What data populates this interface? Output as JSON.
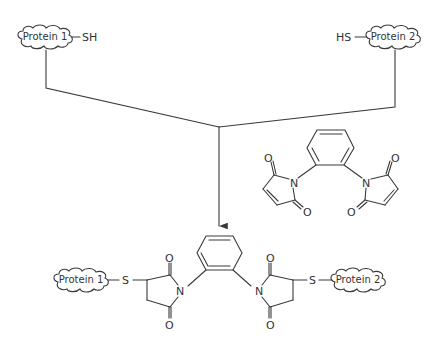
{
  "diagram": {
    "reactants": {
      "protein1": {
        "label": "Protein 1",
        "group": "SH"
      },
      "protein2": {
        "label": "Protein 2",
        "group": "HS"
      }
    },
    "reagent": {
      "name": "o-phenylenebismaleimide",
      "atoms": {
        "n_left": "N",
        "n_right": "N",
        "o1": "O",
        "o2": "O",
        "o3": "O",
        "o4": "O"
      }
    },
    "product": {
      "protein1": {
        "label": "Protein 1",
        "linker": "S"
      },
      "protein2": {
        "label": "Protein 2",
        "linker": "S"
      },
      "atoms": {
        "n_left": "N",
        "n_right": "N",
        "o1": "O",
        "o2": "O",
        "o3": "O",
        "o4": "O"
      }
    },
    "colors": {
      "line": "#3a3a3a",
      "text": "#333333",
      "background": "#ffffff"
    }
  }
}
